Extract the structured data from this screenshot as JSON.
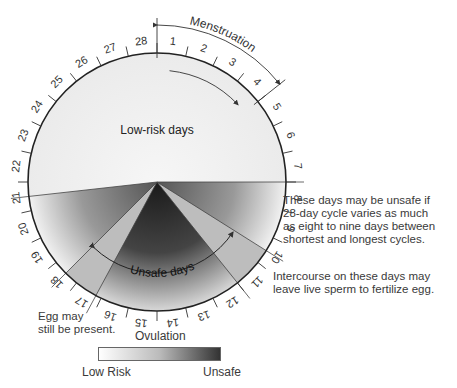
{
  "diagram": {
    "type": "menstrual-cycle-wheel",
    "days": [
      "1",
      "2",
      "3",
      "4",
      "5",
      "6",
      "7",
      "8",
      "9",
      "10",
      "11",
      "12",
      "13",
      "14",
      "15",
      "16",
      "17",
      "18",
      "19",
      "20",
      "21",
      "22",
      "23",
      "24",
      "25",
      "26",
      "27",
      "28"
    ],
    "labels": {
      "menstruation": "Menstruation",
      "low_risk_days": "Low-risk days",
      "unsafe_days": "Unsafe days",
      "ovulation": "Ovulation"
    },
    "notes": {
      "variable_cycle": [
        "These days may be unsafe if",
        "28-day cycle varies as much",
        "as eight to nine days between",
        "shortest and longest cycles."
      ],
      "sperm": [
        "Intercourse on these days may",
        "leave live sperm to fertilize egg."
      ],
      "egg": [
        "Egg may",
        "still be present."
      ]
    },
    "legend": {
      "low": "Low Risk",
      "high": "Unsafe",
      "colors": [
        "#ffffff",
        "#333333"
      ]
    }
  }
}
